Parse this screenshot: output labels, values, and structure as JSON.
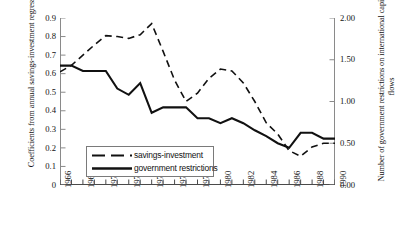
{
  "chart_data": {
    "type": "line",
    "title": "",
    "xlabel": "",
    "ylabel": "Coefficients from annual savings-investment regressions",
    "y2label": "Number of government restrictions on international capital flows",
    "grid": false,
    "legend_position": "inside-bottom-left",
    "x": [
      1966,
      1967,
      1968,
      1969,
      1970,
      1971,
      1972,
      1973,
      1974,
      1975,
      1976,
      1977,
      1978,
      1979,
      1980,
      1981,
      1982,
      1983,
      1984,
      1985,
      1986,
      1987,
      1988,
      1989,
      1990
    ],
    "xlim": [
      1966,
      1990
    ],
    "xtick_labels": [
      "1966",
      "1968",
      "1970",
      "1972",
      "1974",
      "1976",
      "1978",
      "1980",
      "1982",
      "1984",
      "1986",
      "1988",
      "1990"
    ],
    "xtick_values": [
      1966,
      1968,
      1970,
      1972,
      1974,
      1976,
      1978,
      1980,
      1982,
      1984,
      1986,
      1988,
      1990
    ],
    "ylim": [
      0,
      0.9
    ],
    "ytick_labels": [
      "0",
      "0.1",
      "0.2",
      "0.3",
      "0.4",
      "0.5",
      "0.6",
      "0.7",
      "0.8",
      "0.9"
    ],
    "ytick_values": [
      0,
      0.1,
      0.2,
      0.3,
      0.4,
      0.5,
      0.6,
      0.7,
      0.8,
      0.9
    ],
    "y2lim": [
      0,
      2.0
    ],
    "y2tick_labels": [
      "0.00",
      "0.50",
      "1.00",
      "1.50",
      "2.00"
    ],
    "y2tick_values": [
      0,
      0.5,
      1.0,
      1.5,
      2.0
    ],
    "series": [
      {
        "name": "savings-investment",
        "axis": "left",
        "style": "dashed",
        "color": "#111111",
        "values": [
          0.61,
          0.645,
          0.7,
          0.755,
          0.805,
          0.8,
          0.79,
          0.81,
          0.87,
          0.72,
          0.565,
          0.45,
          0.495,
          0.575,
          0.625,
          0.615,
          0.55,
          0.45,
          0.335,
          0.275,
          0.185,
          0.155,
          0.205,
          0.225,
          0.225
        ]
      },
      {
        "name": "government restrictions",
        "axis": "right",
        "style": "solid",
        "color": "#111111",
        "values": [
          1.43,
          1.43,
          1.365,
          1.365,
          1.365,
          1.155,
          1.08,
          1.22,
          0.865,
          0.93,
          0.93,
          0.93,
          0.8,
          0.8,
          0.74,
          0.8,
          0.74,
          0.655,
          0.585,
          0.5,
          0.445,
          0.625,
          0.625,
          0.555,
          0.555
        ]
      }
    ]
  },
  "legend": {
    "items": [
      {
        "label": "savings-investment",
        "style": "dashed"
      },
      {
        "label": "government restrictions",
        "style": "solid"
      }
    ]
  }
}
